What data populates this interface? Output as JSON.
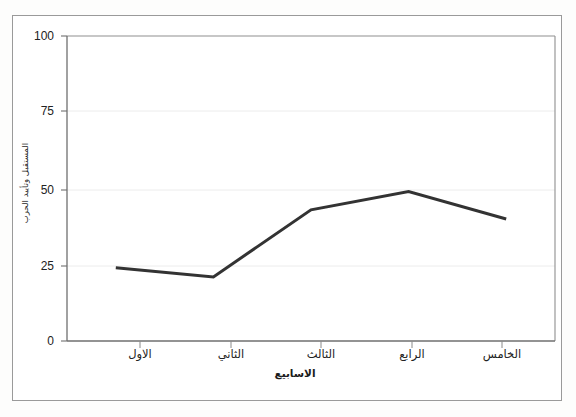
{
  "figure": {
    "border_color": "#9a9a9a",
    "background": "#ffffff"
  },
  "chart_data": {
    "type": "line",
    "title": "",
    "subtitle": "",
    "xlabel": "الاسابيع",
    "ylabel": "المستقبل وتأييد الحرب",
    "categories": [
      "الاول",
      "الثاني",
      "الثالث",
      "الرابع",
      "الخامس"
    ],
    "values": [
      24,
      21,
      43,
      49,
      40
    ],
    "series": [
      {
        "name": "المستقبل وتأييد الحرب",
        "values": [
          24,
          21,
          43,
          49,
          40
        ],
        "color": "#333333"
      }
    ],
    "ylim": [
      0,
      100
    ],
    "yticks": [
      0,
      25,
      50,
      75,
      100
    ],
    "ytick_labels": [
      "0",
      "25",
      "50",
      "75",
      "100"
    ],
    "grid": true,
    "grid_color": "#e6e6e6",
    "legend": false,
    "legend_position": "none",
    "line_color": "#333333",
    "line_width": 3,
    "markers": false,
    "axis_color": "#8c8c8c"
  },
  "axis": {
    "y_ticks": [
      {
        "label": "100",
        "value": 100
      },
      {
        "label": "75",
        "value": 75
      },
      {
        "label": "50",
        "value": 50
      },
      {
        "label": "25",
        "value": 25
      },
      {
        "label": "0",
        "value": 0
      }
    ],
    "x_ticks": [
      {
        "label": "الاول",
        "index": 1
      },
      {
        "label": "الثاني",
        "index": 2
      },
      {
        "label": "الثالث",
        "index": 3
      },
      {
        "label": "الرابع",
        "index": 4
      },
      {
        "label": "الخامس",
        "index": 5
      }
    ]
  }
}
